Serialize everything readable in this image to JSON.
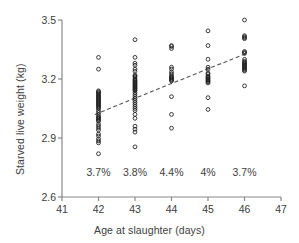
{
  "chart_data": {
    "type": "scatter",
    "title": "",
    "xlabel": "Age at slaughter (days)",
    "ylabel": "Starved live weight (kg)",
    "xlim": [
      41,
      47
    ],
    "ylim": [
      2.6,
      3.5
    ],
    "xticks": [
      41,
      42,
      43,
      44,
      45,
      46,
      47
    ],
    "xticklabels": [
      "41",
      "42",
      "43",
      "44",
      "45",
      "46",
      "47"
    ],
    "yticks": [
      2.6,
      2.9,
      3.2,
      3.5
    ],
    "yticklabels": [
      "2.6",
      "2.9",
      "3.2",
      "3.5"
    ],
    "grid": false,
    "legend": null,
    "marker": "open-circle",
    "annotations": [
      {
        "x": 42,
        "label": "3.7%"
      },
      {
        "x": 43,
        "label": "3.8%"
      },
      {
        "x": 44,
        "label": "4.4%"
      },
      {
        "x": 45,
        "label": "4%"
      },
      {
        "x": 46,
        "label": "3.7%"
      }
    ],
    "annotation_y": 2.72,
    "trendline": {
      "style": "dashed",
      "x": [
        41.9,
        46.05
      ],
      "y": [
        3.02,
        3.33
      ],
      "color": "#555555"
    },
    "series": [
      {
        "name": "Starved live weight",
        "x": [
          42,
          42,
          42,
          42,
          42,
          42,
          42,
          42,
          42,
          42,
          42,
          42,
          42,
          42,
          42,
          42,
          42,
          42,
          42,
          42,
          42,
          42,
          42,
          42,
          42,
          42,
          42,
          42,
          42,
          42,
          42,
          42,
          42,
          42,
          42,
          42,
          42,
          42,
          42,
          42,
          43,
          43,
          43,
          43,
          43,
          43,
          43,
          43,
          43,
          43,
          43,
          43,
          43,
          43,
          43,
          43,
          43,
          43,
          43,
          43,
          43,
          43,
          43,
          43,
          43,
          43,
          43,
          43,
          43,
          43,
          43,
          43,
          43,
          43,
          43,
          43,
          43,
          43,
          44,
          44,
          44,
          44,
          44,
          44,
          44,
          44,
          44,
          44,
          44,
          44,
          44,
          44,
          44,
          44,
          45,
          45,
          45,
          45,
          45,
          45,
          45,
          45,
          45,
          45,
          45,
          45,
          45,
          45,
          45,
          45,
          45,
          46,
          46,
          46,
          46,
          46,
          46,
          46,
          46,
          46,
          46,
          46,
          46,
          46,
          46,
          46,
          46,
          46,
          46,
          46,
          46,
          46
        ],
        "y": [
          3.31,
          3.25,
          3.14,
          3.135,
          3.13,
          3.125,
          3.12,
          3.115,
          3.11,
          3.105,
          3.1,
          3.095,
          3.09,
          3.085,
          3.08,
          3.075,
          3.07,
          3.065,
          3.06,
          3.055,
          3.05,
          3.04,
          3.03,
          3.02,
          3.01,
          3.005,
          3.0,
          2.995,
          2.99,
          2.985,
          2.97,
          2.96,
          2.95,
          2.94,
          2.92,
          2.91,
          2.895,
          2.885,
          2.875,
          2.82,
          3.4,
          3.31,
          3.28,
          3.27,
          3.25,
          3.24,
          3.22,
          3.215,
          3.21,
          3.2,
          3.195,
          3.19,
          3.185,
          3.18,
          3.175,
          3.17,
          3.165,
          3.16,
          3.155,
          3.15,
          3.145,
          3.14,
          3.13,
          3.12,
          3.11,
          3.1,
          3.09,
          3.08,
          3.07,
          3.06,
          3.05,
          3.04,
          3.02,
          3.0,
          2.96,
          2.945,
          2.93,
          2.855,
          3.37,
          3.365,
          3.355,
          3.26,
          3.25,
          3.235,
          3.225,
          3.215,
          3.21,
          3.205,
          3.2,
          3.195,
          3.19,
          3.11,
          3.02,
          2.95,
          3.445,
          3.37,
          3.3,
          3.26,
          3.25,
          3.23,
          3.225,
          3.215,
          3.21,
          3.205,
          3.2,
          3.195,
          3.19,
          3.185,
          3.18,
          3.105,
          3.045,
          3.5,
          3.42,
          3.415,
          3.41,
          3.405,
          3.34,
          3.335,
          3.33,
          3.3,
          3.29,
          3.285,
          3.28,
          3.275,
          3.27,
          3.265,
          3.26,
          3.255,
          3.25,
          3.245,
          3.24,
          3.165
        ]
      }
    ]
  },
  "axis": {
    "color": "#888888"
  }
}
